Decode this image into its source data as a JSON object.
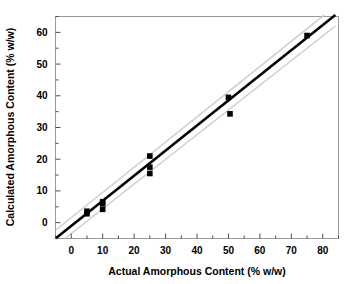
{
  "chart_data": {
    "type": "scatter",
    "title": "",
    "xlabel": "Actual Amorphous Content (% w/w)",
    "ylabel": "Calculated Amorphous Content (% w/w)",
    "xlim": [
      -5,
      85
    ],
    "ylim": [
      -5,
      65
    ],
    "xticks": [
      0,
      10,
      20,
      30,
      40,
      50,
      60,
      70,
      80
    ],
    "yticks": [
      0,
      10,
      20,
      30,
      40,
      50,
      60
    ],
    "xtick_labels": [
      "0",
      "10",
      "20",
      "30",
      "40",
      "50",
      "60",
      "70",
      "80"
    ],
    "ytick_labels": [
      "0",
      "10",
      "20",
      "30",
      "40",
      "50",
      "60"
    ],
    "xminor_step": 5,
    "yminor_step": 5,
    "grid": false,
    "legend": null,
    "marker": "square",
    "marker_color": "#000000",
    "series": [
      {
        "name": "Calculated vs Actual",
        "points": [
          {
            "x": 5.0,
            "y": 3.6
          },
          {
            "x": 5.0,
            "y": 2.8
          },
          {
            "x": 10.0,
            "y": 6.6
          },
          {
            "x": 10.0,
            "y": 6.0
          },
          {
            "x": 10.0,
            "y": 4.2
          },
          {
            "x": 25.0,
            "y": 21.0
          },
          {
            "x": 25.0,
            "y": 17.5
          },
          {
            "x": 25.0,
            "y": 15.5
          },
          {
            "x": 50.0,
            "y": 39.5
          },
          {
            "x": 50.5,
            "y": 34.3
          },
          {
            "x": 75.0,
            "y": 59.0
          }
        ]
      }
    ],
    "fit_line": {
      "name": "regression line",
      "color": "#000000",
      "width": 2.6,
      "x_start": -5.0,
      "y_start": -5.0,
      "x_end": 84.0,
      "y_end": 65.5
    },
    "confidence_bands": [
      {
        "name": "upper confidence band",
        "color": "#cccccc",
        "width": 1.4,
        "x_start": -5.0,
        "y_start": -2.4,
        "x_end": 80.5,
        "y_end": 65.5
      },
      {
        "name": "lower confidence band",
        "color": "#cccccc",
        "width": 1.4,
        "x_start": -2.0,
        "y_start": -5.0,
        "x_end": 84.0,
        "y_end": 62.0
      }
    ],
    "frame": {
      "color": "#999999",
      "width": 1.0
    }
  }
}
